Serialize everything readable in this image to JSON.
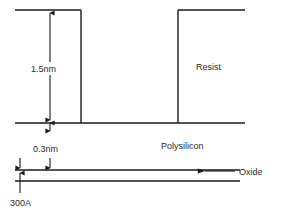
{
  "diagram": {
    "stroke_color": "#1a1a1a",
    "text_color": "#2b2b2b",
    "background_color": "#ffffff",
    "labels": {
      "resist": "Resist",
      "polysilicon": "Polysilicon",
      "oxide": "Oxide",
      "resist_height": "1.5nm",
      "polysilicon_thickness": "0.3nm",
      "oxide_thickness": "300A"
    },
    "measurements": [
      {
        "name": "resist-height",
        "value": "1.5nm",
        "orientation": "vertical",
        "arrow": "double"
      },
      {
        "name": "polysilicon-thickness",
        "value": "0.3nm",
        "orientation": "vertical",
        "arrow": "double"
      },
      {
        "name": "oxide-thickness",
        "value": "300A",
        "orientation": "vertical",
        "arrow": "single-up"
      }
    ],
    "layers": [
      {
        "name": "resist",
        "label": "Resist"
      },
      {
        "name": "polysilicon",
        "label": "Polysilicon"
      },
      {
        "name": "oxide",
        "label": "Oxide"
      }
    ]
  }
}
